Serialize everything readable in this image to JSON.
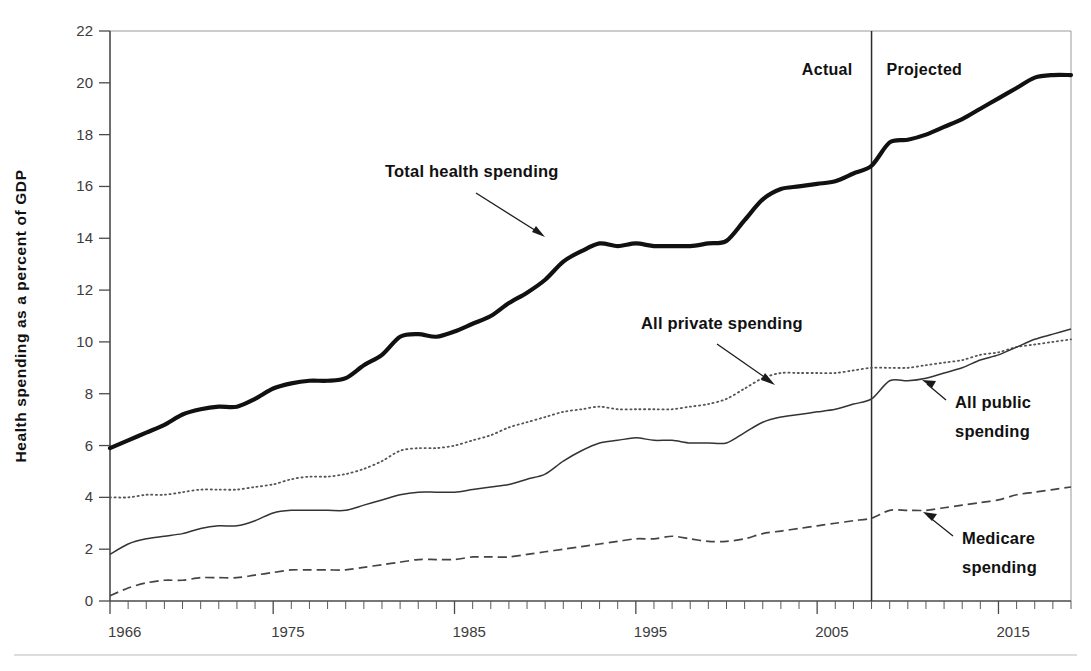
{
  "chart_data": {
    "type": "line",
    "title": "",
    "xlabel": "",
    "ylabel": "Health spending as a percent of GDP",
    "xlim": [
      1966,
      2019
    ],
    "ylim": [
      0,
      22
    ],
    "grid": false,
    "legend_position": "inline-annotations",
    "y_ticks": [
      0,
      2,
      4,
      6,
      8,
      10,
      12,
      14,
      16,
      18,
      20,
      22
    ],
    "y_tick_labels": [
      "0",
      "2",
      "4",
      "6",
      "8",
      "10",
      "12",
      "14",
      "16",
      "18",
      "20",
      "22"
    ],
    "x_ticks": [
      1966,
      1975,
      1985,
      1995,
      2005,
      2015
    ],
    "x_tick_labels": [
      "1966",
      "1975",
      "1985",
      "1995",
      "2005",
      "2015"
    ],
    "x_minor_tick_step": 1,
    "projection_divider_year": 2008,
    "period_labels": [
      {
        "text": "Actual",
        "year": 2004
      },
      {
        "text": "Projected",
        "year": 2011
      }
    ],
    "x": [
      1966,
      1967,
      1968,
      1969,
      1970,
      1971,
      1972,
      1973,
      1974,
      1975,
      1976,
      1977,
      1978,
      1979,
      1980,
      1981,
      1982,
      1983,
      1984,
      1985,
      1986,
      1987,
      1988,
      1989,
      1990,
      1991,
      1992,
      1993,
      1994,
      1995,
      1996,
      1997,
      1998,
      1999,
      2000,
      2001,
      2002,
      2003,
      2004,
      2005,
      2006,
      2007,
      2008,
      2009,
      2010,
      2011,
      2012,
      2013,
      2014,
      2015,
      2016,
      2017,
      2018,
      2019
    ],
    "series": [
      {
        "name": "Total health spending",
        "style": "thick-solid",
        "values": [
          5.9,
          6.2,
          6.5,
          6.8,
          7.2,
          7.4,
          7.5,
          7.5,
          7.8,
          8.2,
          8.4,
          8.5,
          8.5,
          8.6,
          9.1,
          9.5,
          10.2,
          10.3,
          10.2,
          10.4,
          10.7,
          11.0,
          11.5,
          11.9,
          12.4,
          13.1,
          13.5,
          13.8,
          13.7,
          13.8,
          13.7,
          13.7,
          13.7,
          13.8,
          13.9,
          14.7,
          15.5,
          15.9,
          16.0,
          16.1,
          16.2,
          16.5,
          16.8,
          17.7,
          17.8,
          18.0,
          18.3,
          18.6,
          19.0,
          19.4,
          19.8,
          20.2,
          20.3,
          20.3
        ]
      },
      {
        "name": "All private spending",
        "style": "dotted",
        "values": [
          4.0,
          4.0,
          4.1,
          4.1,
          4.2,
          4.3,
          4.3,
          4.3,
          4.4,
          4.5,
          4.7,
          4.8,
          4.8,
          4.9,
          5.1,
          5.4,
          5.8,
          5.9,
          5.9,
          6.0,
          6.2,
          6.4,
          6.7,
          6.9,
          7.1,
          7.3,
          7.4,
          7.5,
          7.4,
          7.4,
          7.4,
          7.4,
          7.5,
          7.6,
          7.8,
          8.2,
          8.6,
          8.8,
          8.8,
          8.8,
          8.8,
          8.9,
          9.0,
          9.0,
          9.0,
          9.1,
          9.2,
          9.3,
          9.5,
          9.6,
          9.8,
          9.9,
          10.0,
          10.1
        ]
      },
      {
        "name": "All public spending",
        "style": "thin-solid",
        "values": [
          1.8,
          2.2,
          2.4,
          2.5,
          2.6,
          2.8,
          2.9,
          2.9,
          3.1,
          3.4,
          3.5,
          3.5,
          3.5,
          3.5,
          3.7,
          3.9,
          4.1,
          4.2,
          4.2,
          4.2,
          4.3,
          4.4,
          4.5,
          4.7,
          4.9,
          5.4,
          5.8,
          6.1,
          6.2,
          6.3,
          6.2,
          6.2,
          6.1,
          6.1,
          6.1,
          6.5,
          6.9,
          7.1,
          7.2,
          7.3,
          7.4,
          7.6,
          7.8,
          8.5,
          8.5,
          8.6,
          8.8,
          9.0,
          9.3,
          9.5,
          9.8,
          10.1,
          10.3,
          10.5
        ]
      },
      {
        "name": "Medicare spending",
        "style": "dashed",
        "values": [
          0.2,
          0.5,
          0.7,
          0.8,
          0.8,
          0.9,
          0.9,
          0.9,
          1.0,
          1.1,
          1.2,
          1.2,
          1.2,
          1.2,
          1.3,
          1.4,
          1.5,
          1.6,
          1.6,
          1.6,
          1.7,
          1.7,
          1.7,
          1.8,
          1.9,
          2.0,
          2.1,
          2.2,
          2.3,
          2.4,
          2.4,
          2.5,
          2.4,
          2.3,
          2.3,
          2.4,
          2.6,
          2.7,
          2.8,
          2.9,
          3.0,
          3.1,
          3.2,
          3.5,
          3.5,
          3.5,
          3.6,
          3.7,
          3.8,
          3.9,
          4.1,
          4.2,
          4.3,
          4.4
        ]
      }
    ],
    "annotations": [
      {
        "text": "Total health spending",
        "target_year": 1992,
        "target_value": 13.6
      },
      {
        "text": "All private spending",
        "target_year": 2003,
        "target_value": 8.7
      },
      {
        "text": "All public spending",
        "target_value": 8.5,
        "target_year": 2009
      },
      {
        "text": "Medicare spending",
        "target_value": 3.5,
        "target_year": 2010
      }
    ]
  },
  "axis": {
    "y_title": "Health spending as a percent of GDP"
  },
  "labels": {
    "actual": "Actual",
    "projected": "Projected",
    "total": "Total health spending",
    "private": "All private spending",
    "public_line1": "All public",
    "public_line2": "spending",
    "medicare_line1": "Medicare",
    "medicare_line2": "spending"
  }
}
